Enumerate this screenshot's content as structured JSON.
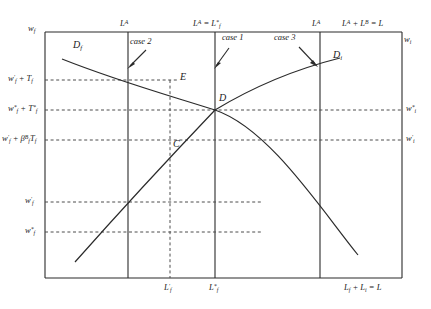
{
  "figure": {
    "type": "line",
    "title": "",
    "axes": {
      "y_left_label": "w_f",
      "y_right_label": "w_i",
      "x_right_label": "L_f + L_i = L"
    },
    "top_labels": [
      {
        "id": "top-la-1",
        "text": "L^A",
        "x": 128
      },
      {
        "id": "top-la-lf",
        "text": "L^A = L*_f",
        "x": 215
      },
      {
        "id": "top-la-2",
        "text": "L^A",
        "x": 320
      },
      {
        "id": "top-total",
        "text": "L^A + L^B = L",
        "x": 402
      }
    ],
    "y_ticks": [
      {
        "id": "tick-wf-prime-tf",
        "text": "w'_f + T_f",
        "y": 80
      },
      {
        "id": "tick-wf-star-tstar",
        "text": "w*_f + T*_f",
        "y": 110
      },
      {
        "id": "tick-wf-prime-beta",
        "text": "w'_f + B^B_f T_f",
        "y": 140
      },
      {
        "id": "tick-wi-prime",
        "text": "w'_f",
        "y": 202
      },
      {
        "id": "tick-wi-star",
        "text": "w*_f",
        "y": 232
      }
    ],
    "y_ticks_right": [
      {
        "id": "tick-wi-star-right",
        "text": "w*_i",
        "y": 110
      },
      {
        "id": "tick-wi-prime-right",
        "text": "w'_i",
        "y": 140
      }
    ],
    "x_ticks": [
      {
        "id": "xtick-lf-prime",
        "text": "L'_f",
        "x": 170
      },
      {
        "id": "xtick-lf-star",
        "text": "L*_f",
        "x": 215
      }
    ],
    "curves": [
      {
        "id": "curve-df",
        "label": "D_f",
        "label_x": 78,
        "label_y": 44,
        "direction": "downward"
      },
      {
        "id": "curve-di",
        "label": "D_i",
        "label_x": 337,
        "label_y": 54,
        "direction": "upward"
      }
    ],
    "points": [
      {
        "id": "point-e",
        "label": "E",
        "x": 177,
        "y": 80
      },
      {
        "id": "point-d",
        "label": "D",
        "x": 215,
        "y": 110
      },
      {
        "id": "point-c",
        "label": "C",
        "x": 172,
        "y": 140
      }
    ],
    "cases": [
      {
        "id": "case-2",
        "label": "case 2",
        "text_x": 131,
        "text_y": 42,
        "target_x": 128,
        "target_y": 68
      },
      {
        "id": "case-1",
        "label": "case 1",
        "text_x": 221,
        "text_y": 38,
        "target_x": 215,
        "target_y": 68
      },
      {
        "id": "case-3",
        "label": "case 3",
        "text_x": 277,
        "text_y": 38,
        "target_x": 316,
        "target_y": 66
      }
    ],
    "colors": {
      "line": "#2b2b2b",
      "dashed": "#4d4d4d",
      "text": "#1a1a1a",
      "background": "#ffffff"
    }
  }
}
